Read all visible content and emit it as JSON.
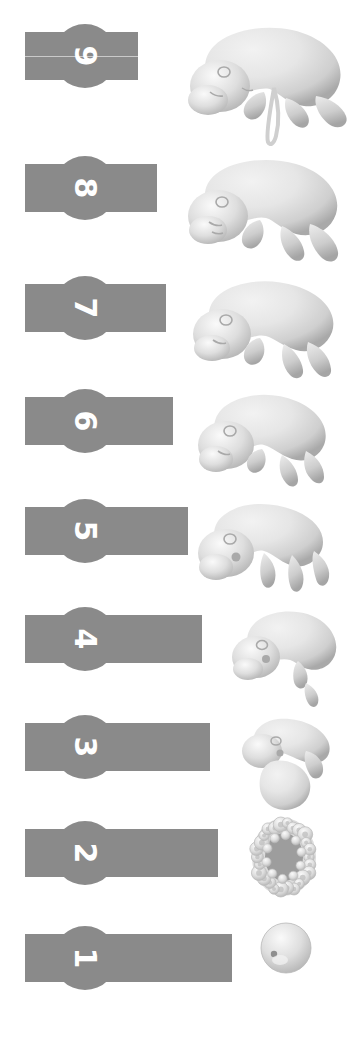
{
  "meta": {
    "background_color": "#ffffff",
    "label_color": "#8a8a8a",
    "number_color": "#ffffff",
    "figure_light": "#e6e6e6",
    "figure_mid": "#cfcfcf",
    "figure_shadow": "#a9a9a9"
  },
  "stages": [
    {
      "number": "9",
      "label_name": "stage-label-9",
      "figure_name": "embryo-figure-9",
      "row_top": 14,
      "row_height": 134,
      "bar_width": 113,
      "bar_height": 48,
      "bar_top": 18,
      "circle_size": 64,
      "circle_left": 28,
      "circle_top": 10,
      "number_size": 30,
      "hairline": true,
      "figure_left": 168,
      "figure_width": 185,
      "figure_height": 134,
      "figure_type": "fetus-late"
    },
    {
      "number": "8",
      "label_name": "stage-label-8",
      "figure_name": "embryo-figure-8",
      "row_top": 148,
      "row_height": 120,
      "bar_width": 132,
      "bar_height": 48,
      "bar_top": 16,
      "circle_size": 64,
      "circle_left": 28,
      "circle_top": 8,
      "number_size": 30,
      "hairline": false,
      "figure_left": 168,
      "figure_width": 185,
      "figure_height": 120,
      "figure_type": "fetus-mid"
    },
    {
      "number": "7",
      "label_name": "stage-label-7",
      "figure_name": "embryo-figure-7",
      "row_top": 268,
      "row_height": 115,
      "bar_width": 141,
      "bar_height": 48,
      "bar_top": 16,
      "circle_size": 64,
      "circle_left": 28,
      "circle_top": 8,
      "number_size": 30,
      "hairline": false,
      "figure_left": 172,
      "figure_width": 178,
      "figure_height": 115,
      "figure_type": "fetus-early"
    },
    {
      "number": "6",
      "label_name": "stage-label-6",
      "figure_name": "embryo-figure-6",
      "row_top": 383,
      "row_height": 110,
      "bar_width": 148,
      "bar_height": 48,
      "bar_top": 14,
      "circle_size": 64,
      "circle_left": 28,
      "circle_top": 6,
      "number_size": 30,
      "hairline": false,
      "figure_left": 178,
      "figure_width": 170,
      "figure_height": 110,
      "figure_type": "embryo-limbbud-late"
    },
    {
      "number": "5",
      "label_name": "stage-label-5",
      "figure_name": "embryo-figure-5",
      "row_top": 493,
      "row_height": 108,
      "bar_width": 163,
      "bar_height": 48,
      "bar_top": 14,
      "circle_size": 64,
      "circle_left": 28,
      "circle_top": 6,
      "number_size": 30,
      "hairline": false,
      "figure_left": 180,
      "figure_width": 168,
      "figure_height": 108,
      "figure_type": "embryo-limbbud"
    },
    {
      "number": "4",
      "label_name": "stage-label-4",
      "figure_name": "embryo-figure-4",
      "row_top": 601,
      "row_height": 108,
      "bar_width": 177,
      "bar_height": 48,
      "bar_top": 14,
      "circle_size": 64,
      "circle_left": 28,
      "circle_top": 6,
      "number_size": 30,
      "hairline": false,
      "figure_left": 222,
      "figure_width": 125,
      "figure_height": 108,
      "figure_type": "embryo-curled"
    },
    {
      "number": "3",
      "label_name": "stage-label-3",
      "figure_name": "embryo-figure-3",
      "row_top": 709,
      "row_height": 106,
      "bar_width": 185,
      "bar_height": 48,
      "bar_top": 14,
      "circle_size": 64,
      "circle_left": 28,
      "circle_top": 6,
      "number_size": 30,
      "hairline": false,
      "figure_left": 230,
      "figure_width": 115,
      "figure_height": 106,
      "figure_type": "embryo-early"
    },
    {
      "number": "2",
      "label_name": "stage-label-2",
      "figure_name": "embryo-figure-2",
      "row_top": 815,
      "row_height": 105,
      "bar_width": 193,
      "bar_height": 48,
      "bar_top": 14,
      "circle_size": 64,
      "circle_left": 28,
      "circle_top": 6,
      "number_size": 30,
      "hairline": false,
      "figure_left": 248,
      "figure_width": 72,
      "figure_height": 84,
      "figure_type": "blastocyst"
    },
    {
      "number": "1",
      "label_name": "stage-label-1",
      "figure_name": "embryo-figure-1",
      "row_top": 920,
      "row_height": 110,
      "bar_width": 207,
      "bar_height": 48,
      "bar_top": 14,
      "circle_size": 64,
      "circle_left": 28,
      "circle_top": 6,
      "number_size": 30,
      "hairline": false,
      "figure_left": 258,
      "figure_width": 56,
      "figure_height": 56,
      "figure_type": "zygote"
    }
  ]
}
